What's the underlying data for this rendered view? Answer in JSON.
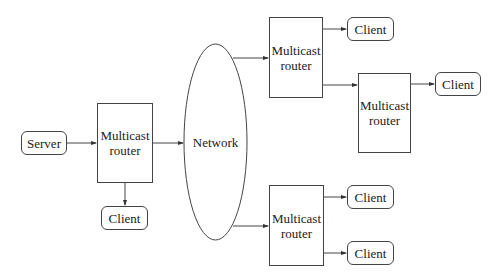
{
  "diagram": {
    "type": "multicast network topology",
    "nodes": {
      "server": {
        "label": "Server"
      },
      "router_main": {
        "label": "Multicast router"
      },
      "client_main": {
        "label": "Client"
      },
      "network": {
        "label": "Network"
      },
      "router_top": {
        "label": "Multicast router"
      },
      "client_top": {
        "label": "Client"
      },
      "router_mid": {
        "label": "Multicast router"
      },
      "client_mid": {
        "label": "Client"
      },
      "router_bottom": {
        "label": "Multicast router"
      },
      "client_bottom_1": {
        "label": "Client"
      },
      "client_bottom_2": {
        "label": "Client"
      }
    },
    "router_line1": "Multicast",
    "router_line2": "router",
    "edges": [
      [
        "server",
        "router_main"
      ],
      [
        "router_main",
        "network"
      ],
      [
        "router_main",
        "client_main"
      ],
      [
        "network",
        "router_top"
      ],
      [
        "network",
        "router_bottom"
      ],
      [
        "router_top",
        "client_top"
      ],
      [
        "router_top",
        "router_mid"
      ],
      [
        "router_mid",
        "client_mid"
      ],
      [
        "router_bottom",
        "client_bottom_1"
      ],
      [
        "router_bottom",
        "client_bottom_2"
      ]
    ]
  }
}
